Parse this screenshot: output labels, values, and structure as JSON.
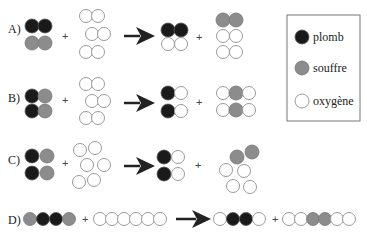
{
  "colors": {
    "plomb": "#1a1a1a",
    "souffre": "#8c8c8c",
    "oxygene": "#ffffff",
    "outline": "#9a9a9a",
    "arrow": "#222222"
  },
  "legend": {
    "items": [
      {
        "key": "plomb",
        "label": "plomb"
      },
      {
        "key": "souffre",
        "label": "souffre"
      },
      {
        "key": "oxygene",
        "label": "oxygène"
      }
    ]
  },
  "rows": [
    {
      "label": "A)",
      "plus1": "+",
      "plus2": "+"
    },
    {
      "label": "B)",
      "plus1": "+",
      "plus2": "+"
    },
    {
      "label": "C)",
      "plus1": "+",
      "plus2": "+"
    },
    {
      "label": "D)",
      "plus1": "+",
      "plus2": "+"
    }
  ]
}
